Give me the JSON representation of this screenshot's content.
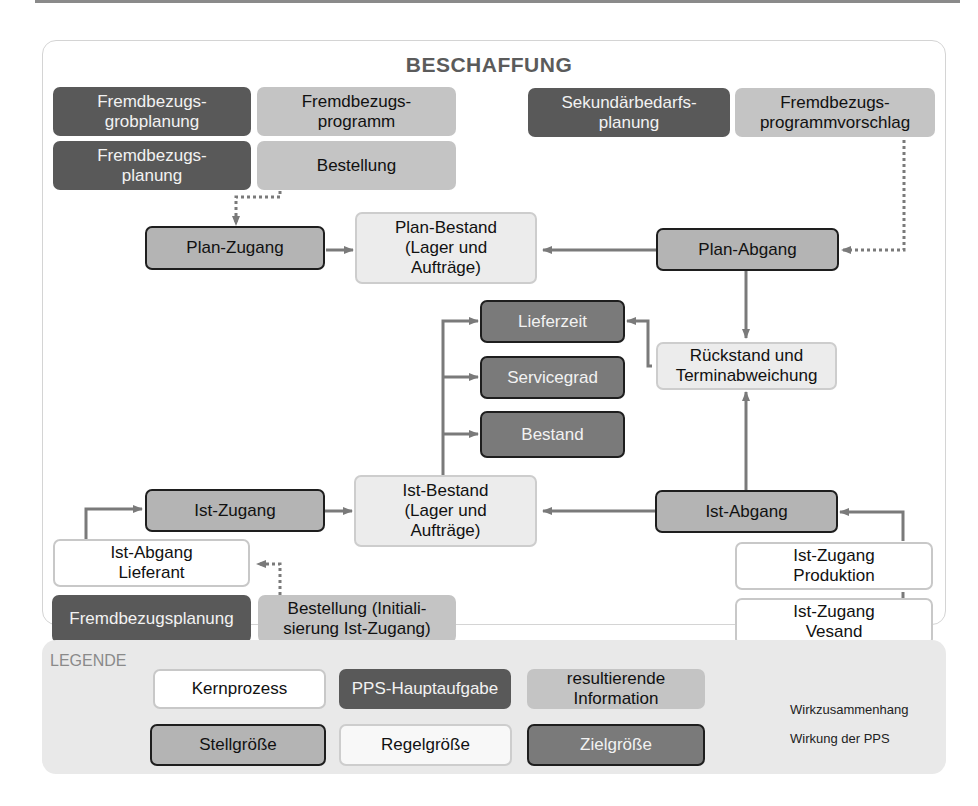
{
  "diagram": {
    "title": "BESCHAFFUNG",
    "pps_tasks": {
      "grobplanung": "Fremdbezugs-\ngrobplanung",
      "planung": "Fremdbezugs-\nplanung",
      "sekundaer": "Sekundärbedarfs-\nplanung",
      "fremdbezugsplanung": "Fremdbezugsplanung"
    },
    "information": {
      "programm": "Fremdbezugs-\nprogramm",
      "bestellung": "Bestellung",
      "vorschlag": "Fremdbezugs-\nprogrammvorschlag",
      "bestellung_init": "Bestellung (Initiali-\nsierung Ist-Zugang)"
    },
    "stellgroessen": {
      "plan_zugang": "Plan-Zugang",
      "plan_abgang": "Plan-Abgang",
      "ist_zugang": "Ist-Zugang",
      "ist_abgang": "Ist-Abgang"
    },
    "regelgroessen": {
      "plan_bestand": "Plan-Bestand\n(Lager und\nAufträge)",
      "rueckstand": "Rückstand und\nTerminabweichung",
      "ist_bestand": "Ist-Bestand\n(Lager und\nAufträge)"
    },
    "zielgroessen": {
      "lieferzeit": "Lieferzeit",
      "servicegrad": "Servicegrad",
      "bestand": "Bestand"
    },
    "kernprozesse": {
      "ist_abgang_lieferant": "Ist-Abgang\nLieferant",
      "ist_zugang_produktion": "Ist-Zugang\nProduktion",
      "ist_zugang_vesand": "Ist-Zugang\nVesand"
    }
  },
  "legend": {
    "title": "LEGENDE",
    "kernprozess": "Kernprozess",
    "pps_hauptaufgabe": "PPS-Hauptaufgabe",
    "resultierende_information": "resultierende\nInformation",
    "stellgroesse": "Stellgröße",
    "regelgroesse": "Regelgröße",
    "zielgroesse": "Zielgröße",
    "wirkzusammenhang": "Wirkzusammenhang",
    "wirkung_pps": "Wirkung der PPS"
  },
  "colors": {
    "pps": "#595959",
    "info": "#c4c4c4",
    "stell": "#b4b4b4",
    "ziel": "#7a7a7a",
    "arrow": "#7a7a7a"
  }
}
